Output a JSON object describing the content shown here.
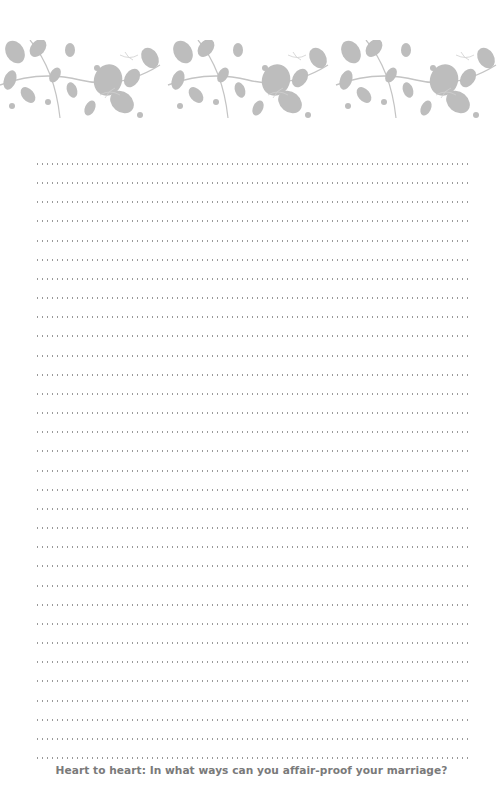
{
  "page": {
    "banner": {
      "icon": "floral-vine-pattern",
      "color": "#b9b9b9"
    },
    "writing_area": {
      "line_count": 32,
      "line_style": "dotted",
      "line_color": "#9a9a9a"
    },
    "prompt": "Heart to heart: In what ways can you affair-proof your marriage?"
  }
}
